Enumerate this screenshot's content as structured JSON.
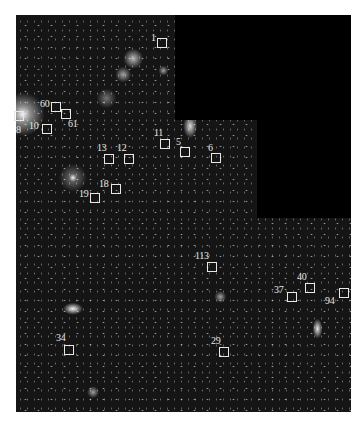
{
  "image": {
    "description": "Deep-field astronomical image with labeled object boxes and a masked (black) region at top right",
    "colors": {
      "background": "#ffffff",
      "sky": "#151515",
      "mask": "#000000",
      "marker": "#e8e8e8"
    }
  },
  "markers": [
    {
      "id": "1",
      "label": "1",
      "box": [
        157,
        38
      ],
      "label_pos": [
        151,
        33
      ]
    },
    {
      "id": "60",
      "label": "60",
      "box": [
        51,
        102
      ],
      "label_pos": [
        40,
        99
      ]
    },
    {
      "id": "61",
      "label": "61",
      "box": [
        61,
        109
      ],
      "label_pos": [
        68,
        119
      ]
    },
    {
      "id": "10",
      "label": "10",
      "box": [
        42,
        124
      ],
      "label_pos": [
        29,
        121
      ]
    },
    {
      "id": "8",
      "label": "8",
      "box": [
        14,
        111
      ],
      "label_pos": [
        16,
        125
      ]
    },
    {
      "id": "11",
      "label": "11",
      "box": [
        160,
        139
      ],
      "label_pos": [
        154,
        128
      ]
    },
    {
      "id": "5",
      "label": "5",
      "box": [
        180,
        147
      ],
      "label_pos": [
        176,
        137
      ]
    },
    {
      "id": "6",
      "label": "6",
      "box": [
        211,
        153
      ],
      "label_pos": [
        208,
        143
      ]
    },
    {
      "id": "13",
      "label": "13",
      "box": [
        104,
        154
      ],
      "label_pos": [
        97,
        143
      ]
    },
    {
      "id": "12",
      "label": "12",
      "box": [
        124,
        154
      ],
      "label_pos": [
        117,
        143
      ]
    },
    {
      "id": "18",
      "label": "18",
      "box": [
        111,
        184
      ],
      "label_pos": [
        99,
        179
      ]
    },
    {
      "id": "19",
      "label": "19",
      "box": [
        90,
        193
      ],
      "label_pos": [
        79,
        189
      ]
    },
    {
      "id": "113",
      "label": "113",
      "box": [
        207,
        262
      ],
      "label_pos": [
        195,
        251
      ]
    },
    {
      "id": "37",
      "label": "37",
      "box": [
        287,
        292
      ],
      "label_pos": [
        274,
        285
      ]
    },
    {
      "id": "40",
      "label": "40",
      "box": [
        305,
        283
      ],
      "label_pos": [
        297,
        272
      ]
    },
    {
      "id": "94",
      "label": "94",
      "box": [
        339,
        288
      ],
      "label_pos": [
        325,
        296
      ]
    },
    {
      "id": "34",
      "label": "34",
      "box": [
        64,
        345
      ],
      "label_pos": [
        56,
        333
      ]
    },
    {
      "id": "29",
      "label": "29",
      "box": [
        219,
        347
      ],
      "label_pos": [
        211,
        336
      ]
    }
  ]
}
